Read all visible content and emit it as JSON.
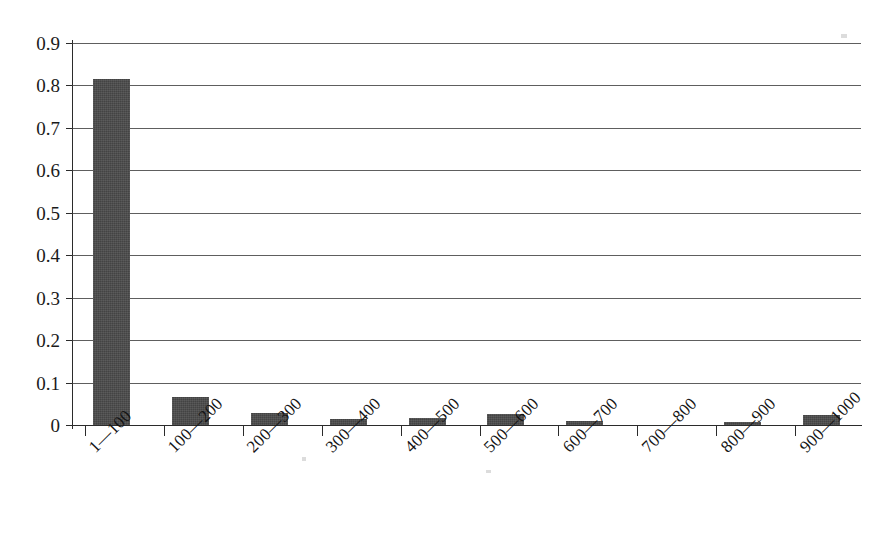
{
  "chart_data": {
    "type": "bar",
    "title": "",
    "subtitle": "",
    "xlabel": "",
    "ylabel": "",
    "categories": [
      "1—100",
      "100—200",
      "200—300",
      "300—400",
      "400—500",
      "500—600",
      "600—700",
      "700—800",
      "800—900",
      "900—1000"
    ],
    "values": [
      0.815,
      0.065,
      0.028,
      0.013,
      0.016,
      0.025,
      0.01,
      0,
      0.006,
      0.023
    ],
    "ylim": [
      0,
      0.9
    ],
    "ytick_labels": [
      "0",
      "0.1",
      "0.2",
      "0.3",
      "0.4",
      "0.5",
      "0.6",
      "0.7",
      "0.8",
      "0.9"
    ],
    "ytick_values": [
      0,
      0.1,
      0.2,
      0.3,
      0.4,
      0.5,
      0.6,
      0.7,
      0.8,
      0.9
    ],
    "grid": true,
    "grid_axis": "y",
    "legend": false,
    "legend_position": "none",
    "bar_color": "#4a4a4a",
    "axis_color": "#2b2b2b",
    "grid_color": "#3a3a3a",
    "background_color": "#ffffff",
    "xtick_label_rotation": -45,
    "series": [
      {
        "name": "frequency",
        "values": [
          0.815,
          0.065,
          0.028,
          0.013,
          0.016,
          0.025,
          0.01,
          0,
          0.006,
          0.023
        ]
      }
    ]
  }
}
